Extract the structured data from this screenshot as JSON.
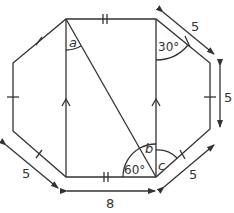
{
  "diagram": {
    "type": "octagon-geometry",
    "stroke_color": "#333333",
    "background": "#ffffff",
    "labels": {
      "angle_a": "a",
      "angle_b": "b",
      "angle_c": "c",
      "angle_30": "30°",
      "angle_60": "60°",
      "len_top_right_diag": "5",
      "len_right_side": "5",
      "len_bottom_right_diag": "5",
      "len_bottom_left_diag": "5",
      "len_bottom": "8"
    }
  }
}
